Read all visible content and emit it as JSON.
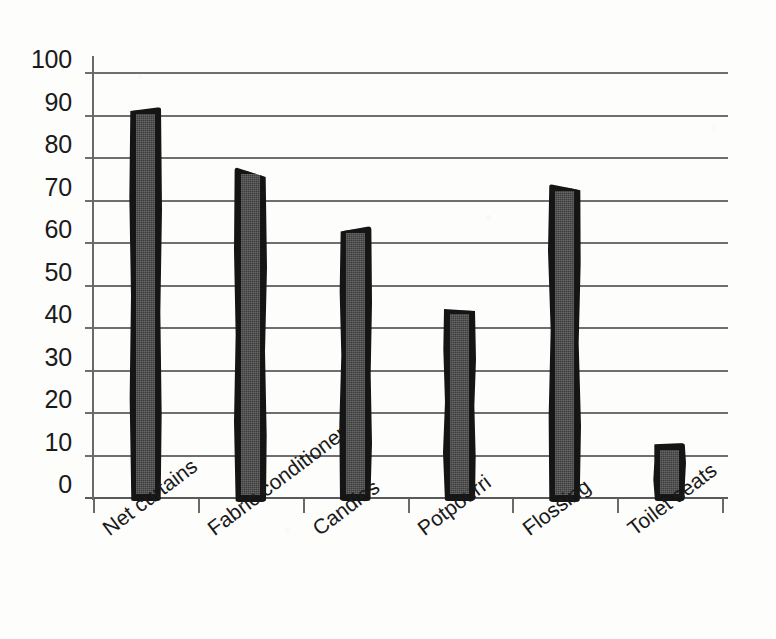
{
  "chart_data": {
    "type": "bar",
    "title": "",
    "subtitle": "",
    "xlabel": "",
    "ylabel": "",
    "categories": [
      "Net curtains",
      "Fabric conditioner",
      "Candles",
      "Potpourri",
      "Flossing",
      "Toilet seats"
    ],
    "values": [
      92,
      78,
      64,
      45,
      74,
      13
    ],
    "ylim": [
      0,
      100
    ],
    "ytick_labels": [
      "100",
      "90",
      "80",
      "70",
      "60",
      "50",
      "40",
      "30",
      "20",
      "10",
      "0"
    ],
    "ytick_values": [
      100,
      90,
      80,
      70,
      60,
      50,
      40,
      30,
      20,
      10,
      0
    ],
    "grid": "horizontal",
    "legend": "none",
    "annotations": [],
    "style": {
      "bar_fill": "#444444",
      "bar_outline": "#151515",
      "gridline_color": "#6f6f6f",
      "axis_color": "#6a6a6a",
      "text_color": "#1a1a1a",
      "background": "#fdfdfc",
      "xlabel_rotation_deg": -37
    }
  }
}
